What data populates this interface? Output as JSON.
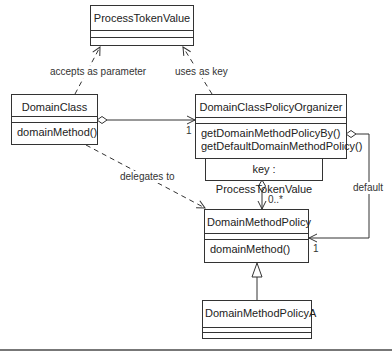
{
  "diagram": {
    "type": "UML class diagram",
    "classes": {
      "process_token_value": {
        "name": "ProcessTokenValue",
        "operations": []
      },
      "domain_class": {
        "name": "DomainClass",
        "operations": [
          "domainMethod()"
        ]
      },
      "organizer": {
        "name": "DomainClassPolicyOrganizer",
        "operations": [
          "getDomainMethodPolicyBy()",
          "getDefaultDomainMethodPolicy()"
        ],
        "qualifier": "key : ProcessTokenValue"
      },
      "policy": {
        "name": "DomainMethodPolicy",
        "operations": [
          "domainMethod()"
        ]
      },
      "policy_a": {
        "name": "DomainMethodPolicyA",
        "operations": []
      }
    },
    "relationships": {
      "accepts": {
        "label": "accepts as parameter",
        "from": "DomainClass",
        "to": "ProcessTokenValue",
        "kind": "dependency"
      },
      "uses_key": {
        "label": "uses as key",
        "from": "DomainClassPolicyOrganizer",
        "to": "ProcessTokenValue",
        "kind": "dependency"
      },
      "delegates": {
        "label": "delegates to",
        "from": "DomainClass",
        "to": "DomainMethodPolicy",
        "kind": "dependency"
      },
      "organizer_assoc": {
        "from": "DomainClass",
        "to": "DomainClassPolicyOrganizer",
        "kind": "aggregation",
        "multiplicity": "1"
      },
      "qualified_assoc": {
        "from": "DomainClassPolicyOrganizer",
        "to": "DomainMethodPolicy",
        "kind": "qualified aggregation",
        "multiplicity": "0..*"
      },
      "default_assoc": {
        "label": "default",
        "from": "DomainClassPolicyOrganizer",
        "to": "DomainMethodPolicy",
        "kind": "aggregation",
        "multiplicity": "1"
      },
      "inherits": {
        "from": "DomainMethodPolicyA",
        "to": "DomainMethodPolicy",
        "kind": "generalization"
      }
    },
    "colors": {
      "line": "#333333",
      "background": "#ffffff",
      "rule": "#777777"
    }
  }
}
